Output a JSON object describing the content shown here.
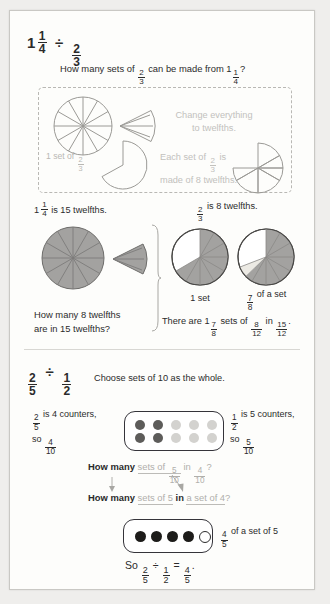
{
  "page": {
    "background": "#fdfdfb",
    "border_color": "#c9c8c4"
  },
  "section1": {
    "title": {
      "whole": "1",
      "num1": "1",
      "den1": "4",
      "op": "÷",
      "num2": "2",
      "den2": "3"
    },
    "question": {
      "prefix": "How many sets of ",
      "frac_num": "2",
      "frac_den": "3",
      "middle": " can be made from 1",
      "mix_num": "1",
      "mix_den": "4",
      "suffix": "?"
    },
    "dashed_panel": {
      "hint1_line1": "Change everything",
      "hint1_line2": "to twelfths.",
      "label_left": "1 set of ",
      "label_left_num": "2",
      "label_left_den": "3",
      "hint2_line1_a": "Each set of ",
      "hint2_num": "2",
      "hint2_den": "3",
      "hint2_line1_b": " is",
      "hint2_line2": "made of 8 twelfths."
    },
    "statements": {
      "left": {
        "whole": "1",
        "num": "1",
        "den": "4",
        "text": " is 15 twelfths."
      },
      "right": {
        "num": "2",
        "den": "3",
        "text": " is 8 twelfths."
      }
    },
    "caption_left_line1": "How many 8 twelfths",
    "caption_left_line2": "are in 15 twelfths?",
    "caption_mid": "1 set",
    "caption_right": {
      "num": "7",
      "den": "8",
      "text": " of a set"
    },
    "conclusion": {
      "prefix": "There are 1",
      "mix_num": "7",
      "mix_den": "8",
      "mid1": " sets of ",
      "f1_num": "8",
      "f1_den": "12",
      "mid2": " in ",
      "f2_num": "15",
      "f2_den": "12",
      "suffix": "."
    }
  },
  "section2": {
    "title": {
      "num1": "2",
      "den1": "5",
      "op": "÷",
      "num2": "1",
      "den2": "2"
    },
    "note": "Choose sets of 10 as the whole.",
    "left_block": {
      "num": "2",
      "den": "5",
      "text": " is 4 counters,",
      "so": "so ",
      "so_num": "4",
      "so_den": "10"
    },
    "right_block": {
      "num": "1",
      "den": "2",
      "text": " is 5 counters,",
      "so": "so ",
      "so_num": "5",
      "so_den": "10"
    },
    "counters_top": {
      "rows": 2,
      "cols": 5,
      "dark_columns": 2,
      "dark_color": "#5d5c5a",
      "light_color": "#d3d2cf"
    },
    "line1": {
      "bold": "How many ",
      "dim1": "sets of ",
      "f1_num": "5",
      "f1_den": "10",
      "dim2": " in ",
      "f2_num": "4",
      "f2_den": "10",
      "suffix": "?"
    },
    "line2": {
      "bold": "How many ",
      "dim1": "sets of 5",
      "mid": " in ",
      "dim2": "a set of 4",
      "suffix": "?"
    },
    "counters_bottom": {
      "total": 5,
      "filled": 4,
      "fill_color": "#1d1c1a",
      "empty_color": "#ffffff"
    },
    "counters_bottom_label": {
      "num": "4",
      "den": "5",
      "text": " of a set of 5"
    },
    "result": {
      "prefix": "So ",
      "n1": "2",
      "d1": "5",
      "op": "÷",
      "n2": "1",
      "d2": "2",
      "eq": "=",
      "n3": "4",
      "d3": "5",
      "suffix": "."
    }
  }
}
